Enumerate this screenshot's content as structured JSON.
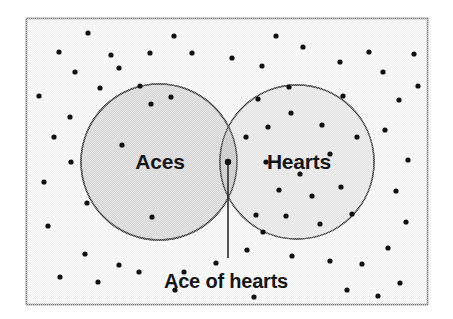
{
  "figure": {
    "type": "venn-diagram",
    "background_color": "#ffffff",
    "frame": {
      "fill": "#f2f2f2",
      "border_color": "#6b6b6b",
      "x": 26,
      "y": 18,
      "width": 402,
      "height": 287
    }
  },
  "sets": [
    {
      "id": "aces",
      "label": "Aces",
      "cx": 159,
      "cy": 162,
      "r": 78,
      "fill": "#d4d4d4",
      "stroke": "#3a3a3a",
      "label_x": 160,
      "label_y": 163
    },
    {
      "id": "hearts",
      "label": "Hearts",
      "cx": 297,
      "cy": 162,
      "r": 77,
      "fill": "#e2e2e2",
      "stroke": "#3a3a3a",
      "label_x": 299,
      "label_y": 163
    }
  ],
  "intersection": {
    "label": "Ace of hearts",
    "fill": "#c2c2c2",
    "marker_x": 228,
    "marker_y": 162,
    "marker_radius": 3.2,
    "leader_line": {
      "x1": 228,
      "y1": 162,
      "x2": 228,
      "y2": 258,
      "color": "#2b2b2b"
    },
    "label_x": 226,
    "label_y": 283
  },
  "dots": {
    "color": "#111111",
    "radius": 2.6,
    "count": 62,
    "points": [
      [
        59,
        52
      ],
      [
        111,
        55
      ],
      [
        150,
        53
      ],
      [
        192,
        53
      ],
      [
        119,
        68
      ],
      [
        232,
        58
      ],
      [
        262,
        66
      ],
      [
        303,
        47
      ],
      [
        340,
        62
      ],
      [
        369,
        52
      ],
      [
        383,
        72
      ],
      [
        414,
        54
      ],
      [
        418,
        86
      ],
      [
        39,
        96
      ],
      [
        75,
        72
      ],
      [
        100,
        88
      ],
      [
        171,
        97
      ],
      [
        54,
        137
      ],
      [
        70,
        117
      ],
      [
        140,
        86
      ],
      [
        44,
        182
      ],
      [
        71,
        162
      ],
      [
        151,
        104
      ],
      [
        48,
        226
      ],
      [
        87,
        203
      ],
      [
        122,
        145
      ],
      [
        152,
        217
      ],
      [
        85,
        254
      ],
      [
        60,
        277
      ],
      [
        98,
        282
      ],
      [
        139,
        272
      ],
      [
        119,
        265
      ],
      [
        184,
        272
      ],
      [
        175,
        290
      ],
      [
        216,
        263
      ],
      [
        247,
        250
      ],
      [
        258,
        99
      ],
      [
        289,
        87
      ],
      [
        246,
        137
      ],
      [
        268,
        127
      ],
      [
        291,
        113
      ],
      [
        322,
        125
      ],
      [
        343,
        96
      ],
      [
        330,
        154
      ],
      [
        357,
        137
      ],
      [
        266,
        162
      ],
      [
        300,
        174
      ],
      [
        279,
        190
      ],
      [
        312,
        196
      ],
      [
        341,
        187
      ],
      [
        385,
        130
      ],
      [
        399,
        100
      ],
      [
        408,
        160
      ],
      [
        396,
        191
      ],
      [
        256,
        215
      ],
      [
        286,
        216
      ],
      [
        320,
        224
      ],
      [
        352,
        214
      ],
      [
        292,
        256
      ],
      [
        330,
        261
      ],
      [
        362,
        264
      ],
      [
        388,
        248
      ],
      [
        406,
        222
      ],
      [
        378,
        296
      ],
      [
        400,
        283
      ],
      [
        347,
        290
      ],
      [
        254,
        297
      ],
      [
        263,
        232
      ],
      [
        174,
        36
      ],
      [
        276,
        36
      ],
      [
        88,
        33
      ]
    ]
  }
}
